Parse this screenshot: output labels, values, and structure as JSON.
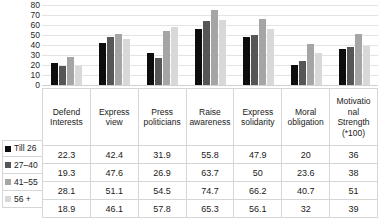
{
  "chart_data": {
    "type": "bar",
    "title": "",
    "subtitle": "",
    "xlabel": "",
    "ylabel": "",
    "ylim": [
      0,
      80
    ],
    "yticks": [
      80,
      70,
      60,
      50,
      40,
      30,
      20,
      10,
      0
    ],
    "grid": true,
    "legend_position": "table-left",
    "categories": [
      "Defend Interests",
      "Express view",
      "Press politicians",
      "Raise awareness",
      "Express solidarity",
      "Moral obligation",
      "Motivatio nal Strength (*100)"
    ],
    "series": [
      {
        "name": "Till 26",
        "color": "#0d0d0d",
        "values": [
          22.3,
          42.4,
          31.9,
          55.8,
          47.9,
          20,
          36
        ]
      },
      {
        "name": "27–40",
        "color": "#565656",
        "values": [
          19.3,
          47.6,
          26.9,
          63.7,
          50,
          23.6,
          38
        ]
      },
      {
        "name": "41–55",
        "color": "#a5a5a5",
        "values": [
          28.1,
          51.1,
          54.5,
          74.7,
          66.2,
          40.7,
          51
        ]
      },
      {
        "name": "56 +",
        "color": "#d8d8d8",
        "values": [
          18.9,
          46.1,
          57.8,
          65.3,
          56.1,
          32,
          39
        ]
      }
    ]
  },
  "table": {
    "header_cells": [
      "Defend Interests",
      "Express view",
      "Press politicians",
      "Raise awareness",
      "Express solidarity",
      "Moral obligation",
      "Motivatio nal Strength (*100)"
    ],
    "rows": [
      {
        "label": "Till 26",
        "cells": [
          "22.3",
          "42.4",
          "31.9",
          "55.8",
          "47.9",
          "20",
          "36"
        ]
      },
      {
        "label": "27–40",
        "cells": [
          "19.3",
          "47.6",
          "26.9",
          "63.7",
          "50",
          "23.6",
          "38"
        ]
      },
      {
        "label": "41–55",
        "cells": [
          "28.1",
          "51.1",
          "54.5",
          "74.7",
          "66.2",
          "40.7",
          "51"
        ]
      },
      {
        "label": "56 +",
        "cells": [
          "18.9",
          "46.1",
          "57.8",
          "65.3",
          "56.1",
          "32",
          "39"
        ]
      }
    ]
  },
  "colors": {
    "series_0": "#0d0d0d",
    "series_1": "#565656",
    "series_2": "#a5a5a5",
    "series_3": "#d8d8d8",
    "gridline": "#e3e3e3",
    "table_border": "#d6d6d6",
    "background": "#ffffff"
  }
}
